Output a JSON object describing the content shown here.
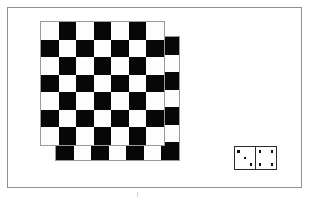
{
  "scene": {
    "title": "Checkerboards and domino illustration",
    "background_color": "#ffffff",
    "width": 312,
    "height": 203
  },
  "frame": {
    "name": "outer-frame",
    "border_color": "#8f8f8f",
    "border_width": 1,
    "left": 7,
    "top": 7,
    "width": 295,
    "height": 181
  },
  "boards": [
    {
      "id": "board-back",
      "label": "Rear checkerboard",
      "rows": 7,
      "cols": 7,
      "cell_size": 17.5,
      "left": 55,
      "top": 36,
      "top_left_color": "dark",
      "dark_color": "#070707",
      "light_color": "#fdfdfd",
      "border_color": "#9a9a9a"
    },
    {
      "id": "board-front",
      "label": "Front checkerboard",
      "rows": 7,
      "cols": 7,
      "cell_size": 17.5,
      "left": 40,
      "top": 21,
      "top_left_color": "light",
      "dark_color": "#070707",
      "light_color": "#fdfdfd",
      "border_color": "#9a9a9a"
    }
  ],
  "domino": {
    "label": "Domino three four",
    "left": 234,
    "top": 146,
    "width": 43,
    "height": 24,
    "border_color": "#2a2a2a",
    "pip_color": "#111111",
    "halves": [
      {
        "id": "domino-left-half",
        "label": "Left half",
        "value": 3,
        "pips": [
          {
            "x": 18,
            "y": 20
          },
          {
            "x": 50,
            "y": 50
          },
          {
            "x": 80,
            "y": 80
          }
        ]
      },
      {
        "id": "domino-right-half",
        "label": "Right half",
        "value": 4,
        "pips": [
          {
            "x": 20,
            "y": 20
          },
          {
            "x": 80,
            "y": 20
          },
          {
            "x": 20,
            "y": 80
          },
          {
            "x": 80,
            "y": 80
          }
        ]
      }
    ]
  },
  "marks": {
    "bottom_tick": {
      "label": "page tick mark",
      "color": "#cfcfcf"
    }
  }
}
